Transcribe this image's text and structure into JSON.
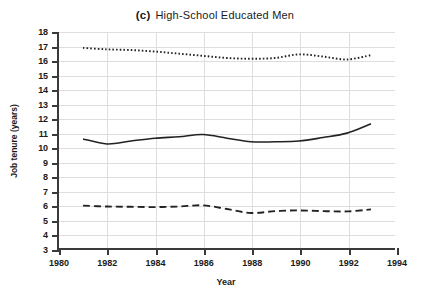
{
  "title": {
    "tag": "(c)",
    "text": "High-School Educated Men"
  },
  "axes": {
    "xlabel": "Year",
    "ylabel": "Job tenure (years)",
    "xticks": [
      "1980",
      "1982",
      "1984",
      "1986",
      "1988",
      "1990",
      "1992",
      "1994"
    ],
    "yticks": [
      "18",
      "17",
      "16",
      "15",
      "14",
      "13",
      "12",
      "11",
      "10",
      "9",
      "8",
      "7",
      "6",
      "5",
      "4",
      "3"
    ]
  },
  "chart_data": {
    "type": "line",
    "xlabel": "Year",
    "ylabel": "Job tenure (years)",
    "xlim": [
      1980,
      1994
    ],
    "ylim": [
      3,
      18
    ],
    "xtick_step": 2,
    "ytick_step": 1,
    "grid": true,
    "legend": "none",
    "x": [
      1981,
      1982,
      1983,
      1984,
      1985,
      1986,
      1987,
      1988,
      1989,
      1990,
      1991,
      1992,
      1993
    ],
    "series": [
      {
        "name": "dotted-upper",
        "style": "dotted",
        "color": "#222222",
        "values": [
          16.9,
          16.8,
          16.75,
          16.65,
          16.5,
          16.35,
          16.2,
          16.15,
          16.2,
          16.45,
          16.3,
          16.1,
          16.4
        ]
      },
      {
        "name": "solid-middle",
        "style": "solid",
        "color": "#222222",
        "values": [
          10.6,
          10.25,
          10.45,
          10.65,
          10.75,
          10.9,
          10.65,
          10.4,
          10.4,
          10.45,
          10.7,
          11.0,
          11.65
        ]
      },
      {
        "name": "dashed-lower",
        "style": "dashed",
        "color": "#222222",
        "values": [
          5.98,
          5.92,
          5.9,
          5.88,
          5.92,
          6.0,
          5.75,
          5.47,
          5.6,
          5.65,
          5.6,
          5.58,
          5.72
        ]
      }
    ]
  }
}
